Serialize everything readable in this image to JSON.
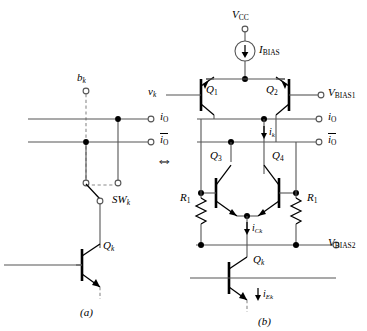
{
  "figure": {
    "kind": "circuit-schematic-pair",
    "equivalence_symbol": "⇔",
    "panels": [
      {
        "id": "a",
        "caption": "(a)"
      },
      {
        "id": "b",
        "caption": "(b)"
      }
    ]
  },
  "panel_a": {
    "caption": "(a)",
    "nodes": {
      "bit_input": "b",
      "bit_input_sub": "k",
      "out_pos": "i",
      "out_pos_sub": "O",
      "out_neg": "i",
      "out_neg_sub": "O",
      "switch": "SW",
      "switch_sub": "k",
      "transistor": "Q",
      "transistor_sub": "k"
    },
    "terminals": [
      {
        "name": "b_k",
        "type": "open-circle"
      },
      {
        "name": "i_O",
        "type": "open-circle"
      },
      {
        "name": "i_O_bar",
        "type": "open-circle"
      }
    ]
  },
  "panel_b": {
    "caption": "(b)",
    "supply": {
      "label": "V",
      "sub": "CC"
    },
    "current_source": {
      "label": "I",
      "sub": "BIAS"
    },
    "inputs": {
      "vk": "v",
      "vk_sub": "k"
    },
    "bias1": {
      "label": "V",
      "sub": "BIAS1"
    },
    "bias2": {
      "label": "V",
      "sub": "BIAS2"
    },
    "outputs": {
      "out_pos": "i",
      "out_pos_sub": "O",
      "out_neg": "i",
      "out_neg_sub": "O"
    },
    "transistors": [
      {
        "name": "Q",
        "sub": "1",
        "type": "pnp"
      },
      {
        "name": "Q",
        "sub": "2",
        "type": "pnp"
      },
      {
        "name": "Q",
        "sub": "3",
        "type": "npn"
      },
      {
        "name": "Q",
        "sub": "4",
        "type": "npn"
      },
      {
        "name": "Q",
        "sub": "k",
        "type": "npn"
      }
    ],
    "resistors": [
      {
        "name": "R",
        "sub": "1",
        "side": "left"
      },
      {
        "name": "R",
        "sub": "1",
        "side": "right"
      }
    ],
    "currents": [
      {
        "name": "i",
        "sub": "k"
      },
      {
        "name": "i",
        "sub": "Ck"
      },
      {
        "name": "i",
        "sub": "Ek"
      }
    ]
  },
  "style": {
    "wire_color": "#555555",
    "device_color": "#000000",
    "dashed_color": "#7a7a7a",
    "background": "#ffffff"
  }
}
